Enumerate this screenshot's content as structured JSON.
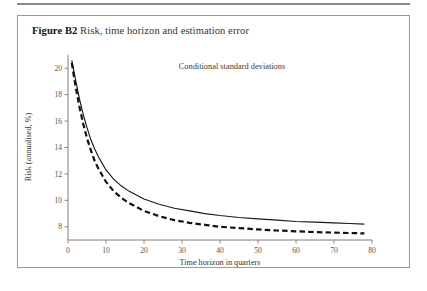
{
  "figure": {
    "label": "Figure B2",
    "title": "Risk, time horizon and estimation error"
  },
  "colors": {
    "frame": "#9a9a9a",
    "rule": "#8a8a8a",
    "axis": "#6d6d6d",
    "solid_series": "#1a1a1a",
    "dashed_series": "#111111",
    "text": "#333333",
    "background": "#ffffff"
  },
  "chart_data": {
    "type": "line",
    "title": "Risk, time horizon and estimation error",
    "annotation": "Conditional standard deviations",
    "xlabel": "Time horizon in quarters",
    "ylabel": "Risk (annualised, %)",
    "xlim": [
      0,
      80
    ],
    "ylim": [
      7,
      21
    ],
    "xticks": [
      0,
      10,
      20,
      30,
      40,
      50,
      60,
      70,
      80
    ],
    "yticks": [
      8,
      10,
      12,
      14,
      16,
      18,
      20
    ],
    "grid": false,
    "legend": "none",
    "x": [
      1,
      2,
      3,
      4,
      5,
      6,
      7,
      8,
      9,
      10,
      12,
      14,
      16,
      18,
      20,
      24,
      28,
      32,
      36,
      40,
      45,
      50,
      55,
      60,
      65,
      70,
      74,
      78
    ],
    "series": [
      {
        "name": "Unconditional (solid)",
        "style": "solid",
        "values": [
          20.6,
          19.1,
          17.7,
          16.5,
          15.5,
          14.6,
          13.9,
          13.3,
          12.8,
          12.3,
          11.6,
          11.1,
          10.7,
          10.4,
          10.1,
          9.7,
          9.4,
          9.2,
          9.0,
          8.85,
          8.7,
          8.6,
          8.5,
          8.4,
          8.35,
          8.3,
          8.25,
          8.2
        ]
      },
      {
        "name": "With estimation error (dashed)",
        "style": "dashed",
        "values": [
          20.4,
          18.6,
          17.1,
          15.8,
          14.7,
          13.8,
          13.0,
          12.4,
          11.9,
          11.4,
          10.7,
          10.2,
          9.8,
          9.5,
          9.2,
          8.8,
          8.5,
          8.3,
          8.15,
          8.0,
          7.9,
          7.8,
          7.72,
          7.66,
          7.6,
          7.56,
          7.53,
          7.5
        ]
      }
    ]
  }
}
